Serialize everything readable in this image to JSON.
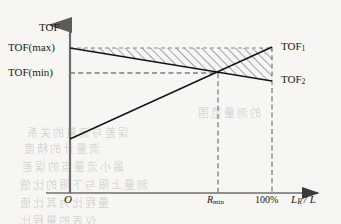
{
  "figure": {
    "axes": {
      "y_axis_label": "TOF",
      "x_axis_label_main": "L",
      "x_axis_label_sub": "R",
      "x_axis_label_tail": "/ L",
      "origin_label": "O"
    },
    "y_ticks": [
      {
        "id": "tof-max",
        "label": "TOF(max)",
        "y": 48
      },
      {
        "id": "tof-min",
        "label": "TOF(min)",
        "y": 73
      }
    ],
    "x_ticks": [
      {
        "id": "r-min",
        "label_main": "R",
        "label_sub": "min",
        "x": 218
      },
      {
        "id": "full-scale",
        "label_main": "100%",
        "label_sub": "",
        "x": 272
      }
    ],
    "curves": [
      {
        "id": "tof-1",
        "label_main": "TOF",
        "label_sub": "1"
      },
      {
        "id": "tof-2",
        "label_main": "TOF",
        "label_sub": "2"
      }
    ],
    "colors": {
      "ink": "#1a1a1a",
      "axis": "#6f6f6f",
      "dash": "#808080",
      "hatch": "#555555",
      "paper": "#f7f6f3"
    },
    "bleed_text": [
      {
        "text": "的测量范围",
        "x": 196,
        "y": 104,
        "size": 11
      },
      {
        "text": "误差与流量的关系",
        "x": 25,
        "y": 124,
        "size": 11
      },
      {
        "text": "流量计的精度",
        "x": 22,
        "y": 140,
        "size": 11
      },
      {
        "text": "最小流量点的误差",
        "x": 20,
        "y": 158,
        "size": 11
      },
      {
        "text": "测量上限与下限的比值",
        "x": 18,
        "y": 176,
        "size": 11
      },
      {
        "text": "量程比为其比值",
        "x": 18,
        "y": 194,
        "size": 11
      },
      {
        "text": "仪表的量程比",
        "x": 18,
        "y": 212,
        "size": 11
      }
    ]
  },
  "chart_data": {
    "type": "line",
    "xlabel": "L_R / L",
    "ylabel": "TOF",
    "xlim": [
      0,
      100
    ],
    "ylim": [
      0,
      1
    ],
    "grid": false,
    "legend": "inline-right",
    "axis_ticks": {
      "x": [
        "O",
        "R_min",
        "100%"
      ],
      "y": [
        "TOF(min)",
        "TOF(max)"
      ]
    },
    "series": [
      {
        "name": "TOF_1",
        "comment": "rising straight line from low value at origin to TOF(max) at 100%",
        "x": [
          0,
          76,
          100
        ],
        "y": [
          0.287,
          0.648,
          0.766
        ]
      },
      {
        "name": "TOF_2",
        "comment": "falling straight line from TOF(max) at x=0 down through crossing at R_min to right edge",
        "x": [
          0,
          76,
          100
        ],
        "y": [
          0.766,
          0.648,
          0.536
        ]
      },
      {
        "name": "TOF(max) reference",
        "comment": "horizontal dashed line at TOF(max) forming top of hatched wedge",
        "x": [
          0,
          100
        ],
        "y": [
          0.766,
          0.766
        ]
      }
    ],
    "annotations": [
      {
        "text": "hatched wedge between TOF(max) horizontal and TOF_2 falling line",
        "type": "region"
      },
      {
        "text": "TOF(min) horizontal dashed guide to crossing point at R_min",
        "type": "guide"
      },
      {
        "text": "vertical dashed guide at R_min",
        "type": "guide"
      },
      {
        "text": "vertical dashed guide at 100%",
        "type": "guide"
      }
    ],
    "crossing_point": {
      "x_label": "R_min",
      "y_label": "TOF(min)"
    }
  }
}
